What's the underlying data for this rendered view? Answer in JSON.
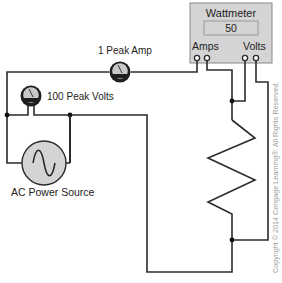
{
  "diagram": {
    "type": "circuit",
    "wattmeter": {
      "title": "Wattmeter",
      "reading": "50",
      "amps_label": "Amps",
      "volts_label": "Volts",
      "fill_color": "#d4d4d4"
    },
    "ammeter": {
      "label": "1 Peak Amp"
    },
    "voltmeter": {
      "label": "100 Peak Volts"
    },
    "source": {
      "label": "AC Power Source"
    },
    "load": {
      "type": "resistor"
    },
    "copyright": "Copyright © 2014 Cengage Learning®. All Rights Reserved."
  }
}
